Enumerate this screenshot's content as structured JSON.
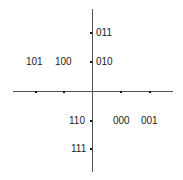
{
  "diagram": {
    "type": "constellation-diagram",
    "axes": {
      "horizontal": {
        "x1": 13,
        "x2": 173,
        "y": 91
      },
      "vertical": {
        "x": 92,
        "y1": 9,
        "y2": 172
      },
      "color": "#555555"
    },
    "points": [
      {
        "code": "011",
        "quadrant": "imaginary-positive",
        "position": "y-axis upper outer"
      },
      {
        "code": "010",
        "quadrant": "imaginary-positive",
        "position": "y-axis upper inner"
      },
      {
        "code": "101",
        "quadrant": "real-negative",
        "position": "x-axis left outer"
      },
      {
        "code": "100",
        "quadrant": "real-negative",
        "position": "x-axis left inner"
      },
      {
        "code": "000",
        "quadrant": "real-positive",
        "position": "x-axis right inner"
      },
      {
        "code": "001",
        "quadrant": "real-positive",
        "position": "x-axis right outer"
      },
      {
        "code": "110",
        "quadrant": "imaginary-negative",
        "position": "y-axis lower inner"
      },
      {
        "code": "111",
        "quadrant": "imaginary-negative",
        "position": "y-axis lower outer"
      }
    ]
  }
}
